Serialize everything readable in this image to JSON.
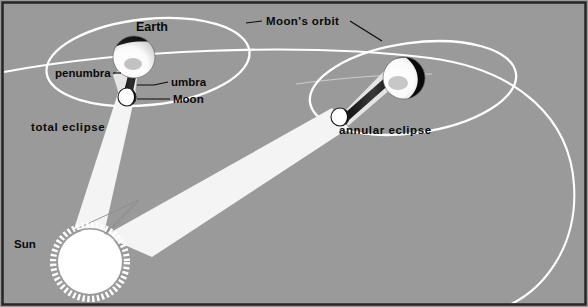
{
  "figure": {
    "title_text": "",
    "background_color": "#9a9a9a",
    "border_color": "#262626",
    "orbit_color": "#ffffff",
    "shadow_umbra_color": "#1a1a1a",
    "shadow_penumbra_color": "#d8d8d8",
    "beam_color": "#f2f2f2",
    "label_color": "#0a0a0a",
    "width": 588,
    "height": 307
  },
  "labels": {
    "earth": "Earth",
    "penumbra": "penumbra",
    "umbra": "umbra",
    "moon": "Moon",
    "total_eclipse": "total eclipse",
    "annular_eclipse": "annular eclipse",
    "moons_orbit": "Moon's orbit",
    "sun": "Sun"
  },
  "bodies": {
    "sun": {
      "name": "Sun",
      "cx": 90,
      "cy": 262,
      "r": 33,
      "corona_spikes": 44,
      "fill": "#ffffff",
      "corona_fill": "#ffffff"
    },
    "earth_left": {
      "name": "Earth",
      "cx": 134,
      "cy": 57,
      "r": 21,
      "lit_side": "lower-left",
      "dark_fill": "#111111",
      "lit_fill": "#ffffff"
    },
    "moon_left": {
      "name": "Moon",
      "cx": 127,
      "cy": 97,
      "r": 9,
      "lit_side": "left",
      "dark_fill": "#111111",
      "lit_fill": "#ffffff"
    },
    "earth_right": {
      "name": "Earth",
      "cx": 404,
      "cy": 78,
      "r": 21,
      "lit_side": "left",
      "dark_fill": "#111111",
      "lit_fill": "#ffffff"
    },
    "moon_right": {
      "name": "Moon",
      "cx": 340,
      "cy": 117,
      "r": 9,
      "lit_side": "left",
      "dark_fill": "#111111",
      "lit_fill": "#ffffff"
    }
  },
  "orbits": {
    "moon_orbit_left": {
      "cx": 148,
      "cy": 62,
      "rx": 102,
      "ry": 43,
      "rotation": -6
    },
    "moon_orbit_right": {
      "cx": 413,
      "cy": 88,
      "rx": 104,
      "ry": 45,
      "rotation": -8
    },
    "earth_orbit_arc": {
      "description": "large sweeping arc representing Earth's orbital path around the Sun"
    }
  },
  "eclipse_cases": [
    {
      "id": "total",
      "label": "total eclipse",
      "description": "Moon's umbra reaches Earth's surface"
    },
    {
      "id": "annular",
      "label": "annular eclipse",
      "description": "Moon's umbra falls short of Earth's surface"
    }
  ]
}
